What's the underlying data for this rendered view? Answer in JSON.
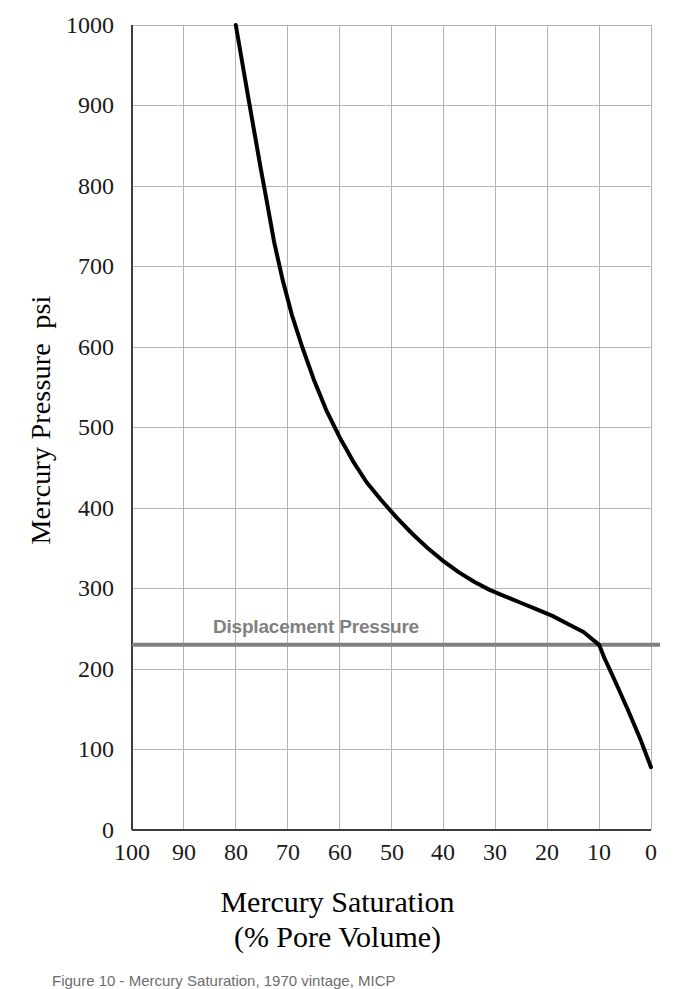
{
  "figure": {
    "caption": "Figure 10 - Mercury Saturation, 1970 vintage, MICP"
  },
  "chart_data": {
    "type": "line",
    "title": "",
    "xlabel": "Mercury Saturation",
    "xlabel_line2": "(% Pore Volume)",
    "ylabel": "Mercury Pressure  psi",
    "xlim": [
      100,
      0
    ],
    "ylim": [
      0,
      1000
    ],
    "x_reversed": true,
    "grid": true,
    "legend": "none",
    "xticks": [
      100,
      90,
      80,
      70,
      60,
      50,
      40,
      30,
      20,
      10,
      0
    ],
    "yticks": [
      0,
      100,
      200,
      300,
      400,
      500,
      600,
      700,
      800,
      900,
      1000
    ],
    "series": [
      {
        "name": "Mercury injection capillary pressure curve",
        "color": "#000000",
        "linewidth": 4,
        "x": [
          80.0,
          78.8,
          77.6,
          76.4,
          75.2,
          74.0,
          72.6,
          71.0,
          69.2,
          67.2,
          65.0,
          62.6,
          60.0,
          57.4,
          54.8,
          52.0,
          49.0,
          46.0,
          43.0,
          40.0,
          37.0,
          34.0,
          31.0,
          28.0,
          25.0,
          22.0,
          19.0,
          16.0,
          13.0,
          10.0,
          9.0,
          7.0,
          4.5,
          2.0,
          0.0
        ],
        "y": [
          1000,
          955,
          910,
          866,
          822,
          780,
          730,
          684,
          640,
          600,
          560,
          522,
          488,
          458,
          432,
          410,
          388,
          368,
          350,
          334,
          320,
          308,
          298,
          290,
          282,
          274,
          266,
          256,
          246,
          230,
          214,
          186,
          150,
          112,
          78
        ]
      }
    ],
    "annotations": [
      {
        "type": "hline",
        "label": "Displacement Pressure",
        "value": 230,
        "color": "#808080",
        "linewidth": 4,
        "label_color": "#808080"
      }
    ]
  }
}
